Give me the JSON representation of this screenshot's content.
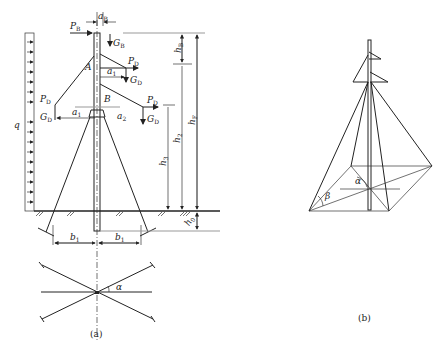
{
  "figure_a": {
    "caption": "(a)",
    "labels": {
      "aB": "a",
      "aB_sub": "B",
      "PB": "P",
      "PB_sub": "B",
      "GB": "G",
      "GB_sub": "B",
      "PD_top": "P",
      "PD_top_sub": "D",
      "a1": "a",
      "a1_sub": "1",
      "GD_top": "G",
      "GD_top_sub": "D",
      "A": "A",
      "B": "B",
      "PD_left": "P",
      "PD_left_sub": "D",
      "GD_left": "G",
      "GD_left_sub": "D",
      "PD_right": "P",
      "PD_right_sub": "D",
      "GD_right": "G",
      "GD_right_sub": "D",
      "a_left": "a",
      "a_left_sub": "1",
      "a_right": "a",
      "a_right_sub": "2",
      "q": "q",
      "hB": "h",
      "hB_sub": "B",
      "h2": "h",
      "h2_sub": "2",
      "h3": "h",
      "h3_sub": "3",
      "hF": "h",
      "hF_sub": "F",
      "h0": "h",
      "h0_sub": "0",
      "b1_left": "b",
      "b1_left_sub": "1",
      "b1_right": "b",
      "b1_right_sub": "1",
      "alpha": "α"
    }
  },
  "figure_b": {
    "caption": "(b)",
    "labels": {
      "alpha": "α",
      "beta": "β"
    }
  }
}
